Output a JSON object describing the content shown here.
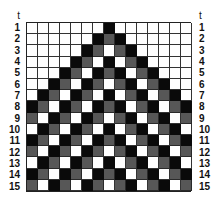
{
  "figure": {
    "axis_label": "t",
    "row_labels": [
      "1",
      "2",
      "3",
      "4",
      "5",
      "6",
      "7",
      "8",
      "9",
      "10",
      "11",
      "12",
      "13",
      "14",
      "15"
    ],
    "columns": 15,
    "state_colors": {
      "W": "#ffffff",
      "G": "#575757",
      "B": "#0a0a0a"
    },
    "rows": [
      "WWWWWWWBWWWWWWW",
      "WWWWWWBGBWWWWWW",
      "WWWWWBGWGBWWWWW",
      "WWWWBGWBWGBWWWW",
      "WWWBGWBGBWGBWWW",
      "WWBGWBGWGBWGBWW",
      "WBGWBGWBWGBWGBW",
      "BGWBGWBGBWGBWGB",
      "GWBGWBGWGBWGBWG",
      "WBGWBGWBWGBWGBW",
      "BGWBGWBGBWGBWGB",
      "GWBGWBGWGBWGBWG",
      "WBGWBGWBWGBWGBW",
      "BGWBGWBGBWGBWGB",
      "GWBGWBGWGBWGBWG"
    ]
  }
}
